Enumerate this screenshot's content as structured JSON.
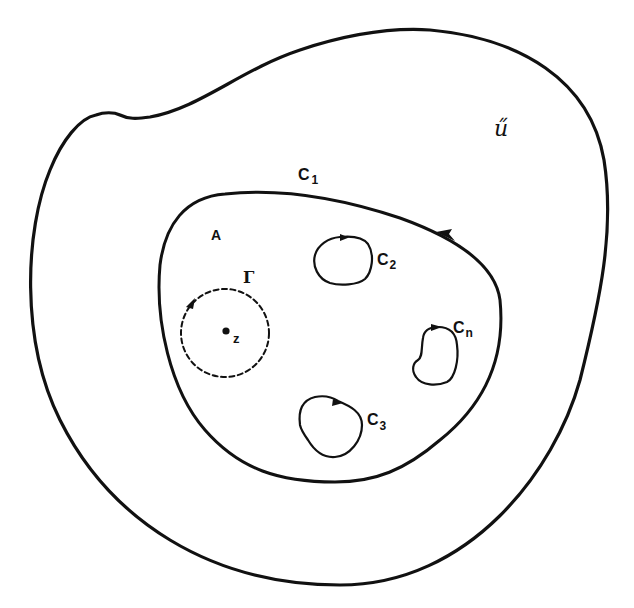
{
  "diagram": {
    "colors": {
      "background": "#ffffff",
      "stroke": "#111111"
    },
    "labels": {
      "outer_region": "ű",
      "outer_region_display": "U",
      "domain": "A",
      "outer_boundary": "C",
      "outer_boundary_sub": "1",
      "hole_2": "C",
      "hole_2_sub": "2",
      "hole_3": "C",
      "hole_3_sub": "3",
      "hole_n": "C",
      "hole_n_sub": "n",
      "gamma": "Γ",
      "point": "z"
    },
    "curves": [
      {
        "name": "U-boundary",
        "style": "solid",
        "orientation": "none"
      },
      {
        "name": "C1",
        "style": "solid",
        "orientation": "counterclockwise",
        "arrow": "left-pointing near top-right"
      },
      {
        "name": "C2",
        "style": "solid",
        "orientation": "clockwise",
        "arrow": "right-pointing at top"
      },
      {
        "name": "C3",
        "style": "solid",
        "orientation": "clockwise",
        "arrow": "right-pointing at top"
      },
      {
        "name": "Cn",
        "style": "solid",
        "orientation": "clockwise",
        "arrow": "right-pointing at top"
      },
      {
        "name": "Gamma",
        "style": "dashed",
        "orientation": "clockwise",
        "arrow": "at upper-left",
        "center": "z"
      }
    ]
  }
}
